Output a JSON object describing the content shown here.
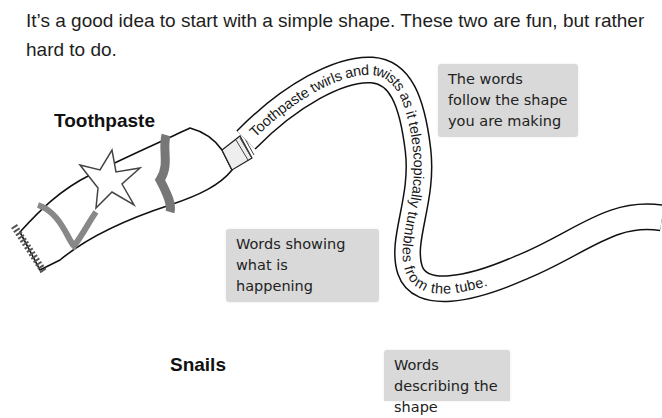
{
  "intro": {
    "text": "It’s a good idea to start with a simple shape. These two are fun, but rather hard to do."
  },
  "sections": {
    "toothpaste": {
      "heading": "Toothpaste",
      "curve_text": "Toothpaste twirls and twists as it telescopically tumbles from the tube.",
      "notes": {
        "follow_shape": "The words follow the shape you are making",
        "happening": "Words showing what is happening"
      }
    },
    "snails": {
      "heading": "Snails",
      "notes": {
        "describing": "Words describing the shape"
      }
    }
  },
  "colors": {
    "note_bg": "#d9d9d9",
    "text": "#1a1a1a"
  }
}
